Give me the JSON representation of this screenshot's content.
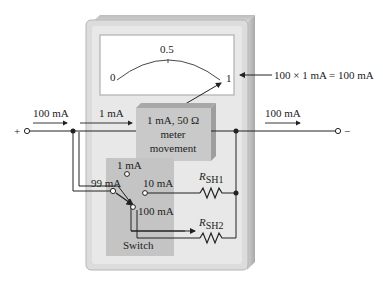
{
  "meter": {
    "scale": {
      "min": "0",
      "mid": "0.5",
      "max": "1"
    },
    "full_scale_note": "100 × 1 mA  = 100 mA",
    "movement": {
      "line1": "1 mA, 50 Ω",
      "line2": "meter",
      "line3": "movement"
    }
  },
  "circuit": {
    "input_current": "100 mA",
    "meter_current": "1 mA",
    "output_current": "100 mA",
    "shunt_current": "99 mA",
    "plus_terminal": "+",
    "minus_terminal": "−"
  },
  "switch": {
    "label": "Switch",
    "positions": [
      "1 mA",
      "10 mA",
      "100 mA"
    ]
  },
  "resistors": {
    "rsh1": {
      "main": "R",
      "sub": "SH1"
    },
    "rsh2": {
      "main": "R",
      "sub": "SH2"
    }
  },
  "colors": {
    "body": "#d9d9d9",
    "body_dark": "#bdbdbd",
    "face": "#ffffff",
    "panel": "#c4c4c4",
    "movement_box": "#c9c9c9",
    "wire": "#222222"
  }
}
